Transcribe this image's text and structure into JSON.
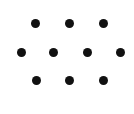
{
  "figure": {
    "width": 134,
    "height": 114,
    "background_color": "#ffffff",
    "dot_color": "#111111",
    "dot_diameter": 9,
    "dot_count": 10,
    "row_count": 3
  },
  "chart_data": {
    "type": "scatter",
    "title": "",
    "xlabel": "",
    "ylabel": "",
    "grid": false,
    "legend": null,
    "xlim": [
      0,
      134
    ],
    "ylim": [
      0,
      114
    ],
    "marker": "circle",
    "marker_size": 9,
    "marker_color": "#111111",
    "rows": [
      {
        "name": "top-row",
        "count": 3,
        "y": 23,
        "x": [
          35,
          69,
          103
        ]
      },
      {
        "name": "middle-row",
        "count": 4,
        "y": 52,
        "x": [
          21,
          53,
          87,
          120
        ]
      },
      {
        "name": "bottom-row",
        "count": 3,
        "y": 80,
        "x": [
          36,
          69,
          103
        ]
      }
    ],
    "points": [
      {
        "x": 35,
        "y": 23
      },
      {
        "x": 69,
        "y": 23
      },
      {
        "x": 103,
        "y": 23
      },
      {
        "x": 21,
        "y": 52
      },
      {
        "x": 53,
        "y": 52
      },
      {
        "x": 87,
        "y": 52
      },
      {
        "x": 120,
        "y": 52
      },
      {
        "x": 36,
        "y": 80
      },
      {
        "x": 69,
        "y": 80
      },
      {
        "x": 103,
        "y": 80
      }
    ]
  }
}
